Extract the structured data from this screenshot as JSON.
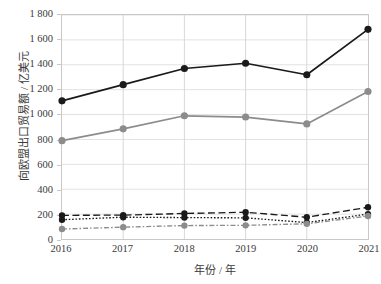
{
  "chart_data": {
    "type": "line",
    "title": "",
    "xlabel": "年份 / 年",
    "ylabel": "向欧盟出口贸易额 / 亿美元",
    "categories": [
      "2016",
      "2017",
      "2018",
      "2019",
      "2020",
      "2021"
    ],
    "x": [
      2016,
      2017,
      2018,
      2019,
      2020,
      2021
    ],
    "xlim": [
      2016,
      2021
    ],
    "ylim": [
      0,
      1800
    ],
    "ytick_labels": [
      "0",
      "200",
      "400",
      "600",
      "800",
      "1 000",
      "1 200",
      "1 400",
      "1 600",
      "1 800"
    ],
    "ytick_values": [
      0,
      200,
      400,
      600,
      800,
      1000,
      1200,
      1400,
      1600,
      1800
    ],
    "grid": "horizontal-and-vertical",
    "legend": "none",
    "series": [
      {
        "name": "series-1-black-solid",
        "values": [
          1110,
          1240,
          1370,
          1412,
          1320,
          1685
        ],
        "color": "#1a1a1a",
        "line_style": "solid",
        "marker": "circle"
      },
      {
        "name": "series-2-gray-solid",
        "values": [
          790,
          885,
          990,
          980,
          925,
          1185
        ],
        "color": "#8c8c8c",
        "line_style": "solid",
        "marker": "circle"
      },
      {
        "name": "series-3-black-dashed",
        "values": [
          190,
          192,
          205,
          215,
          175,
          255
        ],
        "color": "#1a1a1a",
        "line_style": "dashed",
        "marker": "circle"
      },
      {
        "name": "series-4-black-dotted",
        "values": [
          155,
          175,
          172,
          170,
          132,
          200
        ],
        "color": "#1a1a1a",
        "line_style": "dotted",
        "marker": "circle"
      },
      {
        "name": "series-5-gray-dashdot",
        "values": [
          80,
          95,
          108,
          110,
          122,
          185
        ],
        "color": "#8c8c8c",
        "line_style": "dashdot",
        "marker": "circle"
      }
    ]
  }
}
